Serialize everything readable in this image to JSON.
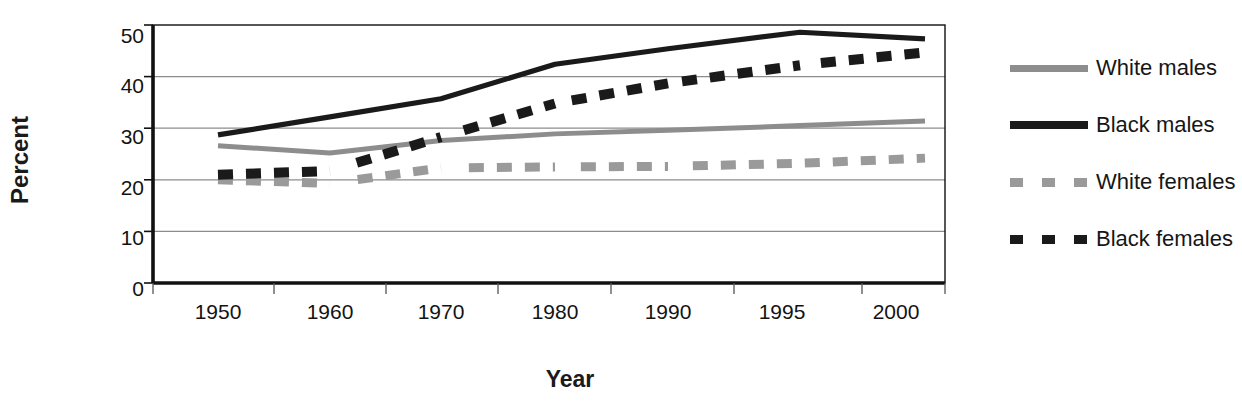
{
  "chart_data": {
    "type": "line",
    "title": "",
    "xlabel": "Year",
    "ylabel": "Percent",
    "categories": [
      "1950",
      "1960",
      "1970",
      "1980",
      "1990",
      "1995",
      "2000"
    ],
    "x": [
      1950,
      1960,
      1970,
      1980,
      1990,
      1995,
      2000
    ],
    "ylim": [
      0,
      50
    ],
    "yticks": [
      "0",
      "10",
      "20",
      "30",
      "40",
      "50"
    ],
    "ytick_values": [
      0,
      10,
      20,
      30,
      40,
      50
    ],
    "grid": "horizontal",
    "legend_position": "right",
    "series": [
      {
        "name": "White males",
        "style": "solid",
        "color": "#8d8d8d",
        "values": [
          26.6,
          25.2,
          27.6,
          28.9,
          29.6,
          30.5,
          31.4
        ]
      },
      {
        "name": "Black males",
        "style": "solid",
        "color": "#1a1a1a",
        "values": [
          28.7,
          32.2,
          35.7,
          42.4,
          45.4,
          48.6,
          47.3
        ]
      },
      {
        "name": "White females",
        "style": "dashed",
        "color": "#9a9a9a",
        "values": [
          20.0,
          19.3,
          22.3,
          22.5,
          22.6,
          23.2,
          24.2
        ]
      },
      {
        "name": "Black females",
        "style": "dashed",
        "color": "#1a1a1a",
        "values": [
          21.0,
          21.7,
          28.3,
          34.8,
          38.7,
          42.2,
          44.7
        ]
      }
    ]
  },
  "axis": {
    "y_title": "Percent",
    "x_title": "Year"
  },
  "legend": {
    "items": [
      {
        "label": "White males",
        "key": "solid-gray-line-key"
      },
      {
        "label": "Black males",
        "key": "solid-black-line-key"
      },
      {
        "label": "White females",
        "key": "dashed-gray-line-key"
      },
      {
        "label": "Black females",
        "key": "dashed-black-line-key"
      }
    ]
  },
  "colors": {
    "white_series": "#8d8d8d",
    "black_series": "#1a1a1a",
    "gridline": "#8c8c8c",
    "axis": "#111111",
    "background": "#ffffff"
  }
}
